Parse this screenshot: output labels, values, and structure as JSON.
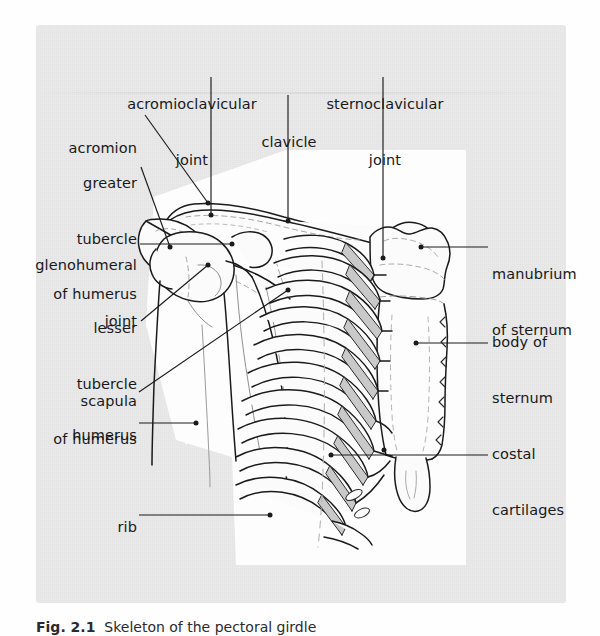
{
  "page": {
    "background_color": "#fefefe",
    "panel_color": "#eaeaea",
    "illustration_color": "#fdfdfd",
    "ink_color": "#1a1a1c",
    "cartilage_shade": "#c9c9c9"
  },
  "figure": {
    "caption_number": "Fig. 2.1",
    "caption_text": "  Skeleton of the pectoral girdle"
  },
  "labels": [
    {
      "id": "acromioclavicular-joint",
      "text": "acromioclavicular\njoint",
      "align": "center"
    },
    {
      "id": "sternoclavicular-joint",
      "text": "sternoclavicular\njoint",
      "align": "center"
    },
    {
      "id": "clavicle",
      "text": "clavicle",
      "align": "center"
    },
    {
      "id": "acromion",
      "text": "acromion",
      "align": "right"
    },
    {
      "id": "greater-tubercle-of-humerus",
      "text": "greater\ntubercle\nof humerus",
      "align": "right"
    },
    {
      "id": "glenohumeral-joint",
      "text": "glenohumeral\njoint",
      "align": "right"
    },
    {
      "id": "lesser-tubercle-of-humerus",
      "text": "lesser\ntubercle\nof humerus",
      "align": "right"
    },
    {
      "id": "scapula",
      "text": "scapula",
      "align": "right"
    },
    {
      "id": "humerus",
      "text": "humerus",
      "align": "right"
    },
    {
      "id": "rib",
      "text": "rib",
      "align": "right"
    },
    {
      "id": "manubrium-of-sternum",
      "text": "manubrium\nof sternum",
      "align": "left"
    },
    {
      "id": "body-of-sternum",
      "text": "body of\nsternum",
      "align": "left"
    },
    {
      "id": "costal-cartilages",
      "text": "costal\ncartilages",
      "align": "left"
    }
  ],
  "label_text": {
    "acromioclavicular_joint_line1": "acromioclavicular",
    "acromioclavicular_joint_line2": "joint",
    "sternoclavicular_joint_line1": "sternoclavicular",
    "sternoclavicular_joint_line2": "joint",
    "clavicle": "clavicle",
    "acromion": "acromion",
    "greater_tubercle_line1": "greater",
    "greater_tubercle_line2": "tubercle",
    "greater_tubercle_line3": "of humerus",
    "glenohumeral_joint_line1": "glenohumeral",
    "glenohumeral_joint_line2": "joint",
    "lesser_tubercle_line1": "lesser",
    "lesser_tubercle_line2": "tubercle",
    "lesser_tubercle_line3": "of humerus",
    "scapula": "scapula",
    "humerus": "humerus",
    "rib": "rib",
    "manubrium_line1": "manubrium",
    "manubrium_line2": "of sternum",
    "body_of_sternum_line1": "body of",
    "body_of_sternum_line2": "sternum",
    "costal_cartilages_line1": "costal",
    "costal_cartilages_line2": "cartilages"
  },
  "anatomy": {
    "view": "anterior view of right pectoral girdle and thorax",
    "structures": [
      "clavicle",
      "scapula",
      "humerus",
      "acromion",
      "greater tubercle of humerus",
      "lesser tubercle of humerus",
      "acromioclavicular joint",
      "glenohumeral joint",
      "sternoclavicular joint",
      "manubrium of sternum",
      "body of sternum",
      "xiphoid process",
      "ribs",
      "costal cartilages"
    ],
    "rib_pairs_drawn": 10
  }
}
